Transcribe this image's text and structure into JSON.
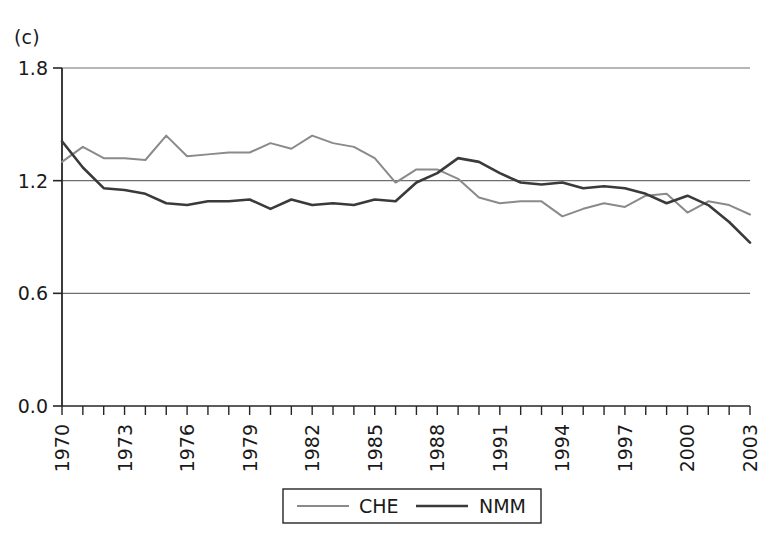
{
  "panel": {
    "label": "(c)"
  },
  "legend": {
    "position": "bottom-center",
    "entries": [
      {
        "name": "CHE",
        "color": "#8a8a8a"
      },
      {
        "name": "NMM",
        "color": "#3a3a3a"
      }
    ]
  },
  "axes": {
    "y_ticks": [
      "0.0",
      "0.6",
      "1.2",
      "1.8"
    ],
    "x_ticks": [
      "1970",
      "1973",
      "1976",
      "1979",
      "1982",
      "1985",
      "1988",
      "1991",
      "1994",
      "1997",
      "2000",
      "2003"
    ]
  },
  "chart_data": {
    "type": "line",
    "title": "(c)",
    "xlabel": "",
    "ylabel": "",
    "ylim": [
      0.0,
      1.8
    ],
    "xlim": [
      1970,
      2003
    ],
    "grid": true,
    "grid_axis": "y",
    "legend_position": "bottom-center",
    "x": [
      1970,
      1971,
      1972,
      1973,
      1974,
      1975,
      1976,
      1977,
      1978,
      1979,
      1980,
      1981,
      1982,
      1983,
      1984,
      1985,
      1986,
      1987,
      1988,
      1989,
      1990,
      1991,
      1992,
      1993,
      1994,
      1995,
      1996,
      1997,
      1998,
      1999,
      2000,
      2001,
      2002,
      2003
    ],
    "series": [
      {
        "name": "CHE",
        "color": "#8a8a8a",
        "values": [
          1.3,
          1.38,
          1.32,
          1.32,
          1.31,
          1.44,
          1.33,
          1.34,
          1.35,
          1.35,
          1.4,
          1.37,
          1.44,
          1.4,
          1.38,
          1.32,
          1.19,
          1.26,
          1.26,
          1.21,
          1.11,
          1.08,
          1.09,
          1.09,
          1.01,
          1.05,
          1.08,
          1.06,
          1.12,
          1.13,
          1.03,
          1.09,
          1.07,
          1.02
        ]
      },
      {
        "name": "NMM",
        "color": "#3a3a3a",
        "values": [
          1.41,
          1.27,
          1.16,
          1.15,
          1.13,
          1.08,
          1.07,
          1.09,
          1.09,
          1.1,
          1.05,
          1.1,
          1.07,
          1.08,
          1.07,
          1.1,
          1.09,
          1.19,
          1.24,
          1.32,
          1.3,
          1.24,
          1.19,
          1.18,
          1.19,
          1.16,
          1.17,
          1.16,
          1.13,
          1.08,
          1.12,
          1.07,
          0.98,
          0.87
        ]
      }
    ]
  }
}
